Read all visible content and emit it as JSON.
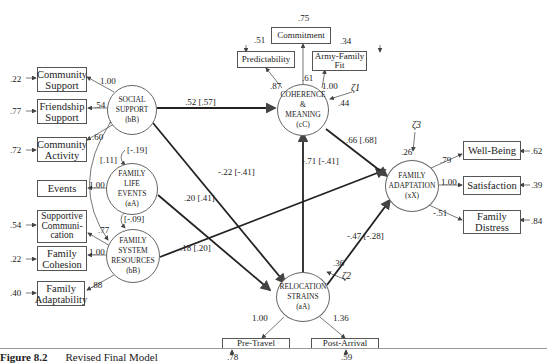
{
  "figure": {
    "caption_number": "Figure 8.2",
    "caption_title": "Revised Final Model"
  },
  "latents": {
    "social_support": {
      "line1": "SOCIAL",
      "line2": "SUPPORT",
      "line3": "(bB)"
    },
    "family_life_events": {
      "line1": "FAMILY",
      "line2": "LIFE",
      "line3": "EVENTS",
      "line4": "(aA)"
    },
    "family_system_resources": {
      "line1": "FAMILY",
      "line2": "SYSTEM",
      "line3": "RESOURCES",
      "line4": "(bB)"
    },
    "coherence_meaning": {
      "line1": "COHERENCE",
      "line2": "&",
      "line3": "MEANING",
      "line4": "(cC)"
    },
    "relocation_strains": {
      "line1": "RELOCATION",
      "line2": "STRAINS",
      "line3": "(aA)"
    },
    "family_adaptation": {
      "line1": "FAMILY",
      "line2": "ADAPTATION",
      "line3": "(xX)"
    }
  },
  "indicators": {
    "community_support": {
      "label": "Community Support",
      "error": ".22",
      "loading": "1.00"
    },
    "friendship_support": {
      "label": "Friendship Support",
      "error": ".77",
      "loading": ".54"
    },
    "community_activity": {
      "label": "Community Activity",
      "error": ".72",
      "loading": ".60"
    },
    "events": {
      "label": "Events",
      "loading": "1.00"
    },
    "supportive_communication": {
      "label": "Supportive Communi-cation",
      "error": ".54",
      "loading": ".77"
    },
    "family_cohesion": {
      "label": "Family Cohesion",
      "error": ".22",
      "loading": "1.00"
    },
    "family_adaptability": {
      "label": "Family Adaptability",
      "error": ".40",
      "loading": ".88"
    },
    "predictability": {
      "label": "Predictability",
      "error": ".51",
      "loading": ".87"
    },
    "commitment": {
      "label": "Commitment",
      "error": ".75",
      "loading": ".61"
    },
    "army_family_fit": {
      "label": "Army-Family Fit",
      "error": ".34",
      "loading": "1.00"
    },
    "pre_travel": {
      "label": "Pre-Travel",
      "error": ".78",
      "loading": "1.00"
    },
    "post_arrival": {
      "label": "Post-Arrival",
      "error": ".59",
      "loading": "1.36"
    },
    "well_being": {
      "label": "Well-Being",
      "error": ".62",
      "loading": ".79"
    },
    "satisfaction": {
      "label": "Satisfaction",
      "error": ".39",
      "loading": "1.00"
    },
    "family_distress": {
      "label": "Family Distress",
      "error": ".84",
      "loading": "-.51"
    }
  },
  "paths": {
    "ss_to_cm": ".52 [.57]",
    "ss_to_rs": "-.22 [-.41]",
    "fle_to_rs": ".20 [.41]",
    "fsr_to_fa": ".18 [.20]",
    "rs_to_cm": "-.71 [-.41]",
    "cm_to_fa": ".66 [.68]",
    "rs_to_fa": "-.47 [-.28]"
  },
  "correlations": {
    "ss_fle": "[-.19]",
    "ss_fsr": "[.11]",
    "fle_fsr": "[-.09]"
  },
  "disturbances": {
    "zeta1": {
      "symbol": "ζ1",
      "value": ".44"
    },
    "zeta2": {
      "symbol": "ζ2",
      "value": ".36"
    },
    "zeta3": {
      "symbol": "ζ3",
      "value": ".26"
    }
  }
}
